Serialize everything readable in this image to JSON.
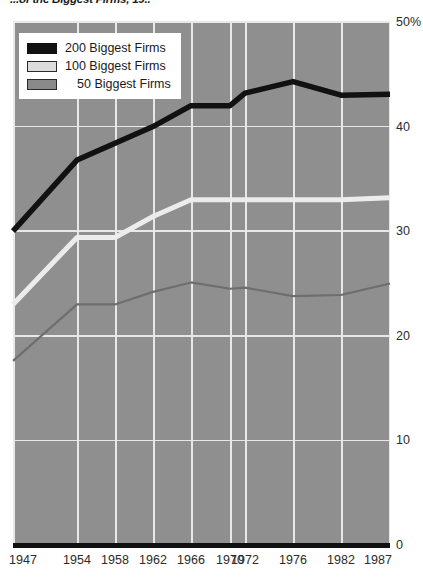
{
  "chart_data": {
    "type": "line",
    "title": "...of the Biggest Firms, 19..",
    "xlabel": "",
    "ylabel": "",
    "grid": true,
    "legend_position": "top-left",
    "x": [
      1947,
      1954,
      1958,
      1962,
      1966,
      1970,
      1972,
      1976,
      1982,
      1987
    ],
    "x_tick_labels": [
      "1947",
      "1954",
      "1958",
      "1962",
      "1966",
      "1970",
      "1972",
      "1976",
      "1982",
      "1987"
    ],
    "y_tick_labels": [
      "0",
      "10",
      "20",
      "30",
      "40",
      "50%"
    ],
    "y_ticks": [
      0,
      10,
      20,
      30,
      40,
      50
    ],
    "ylim": [
      0,
      50
    ],
    "series": [
      {
        "name": "200 Biggest Firms",
        "color": "#111111",
        "values": [
          30.0,
          36.8,
          38.4,
          40.0,
          42.0,
          42.0,
          43.2,
          44.3,
          43.0,
          43.1
        ]
      },
      {
        "name": "100 Biggest Firms",
        "color": "#ececec",
        "values": [
          23.0,
          29.4,
          29.4,
          31.4,
          33.0,
          33.0,
          33.0,
          33.0,
          33.0,
          33.2
        ]
      },
      {
        "name": "50 Biggest Firms",
        "color": "#6e6e6e",
        "values": [
          17.6,
          23.0,
          23.0,
          24.2,
          25.1,
          24.5,
          24.6,
          23.8,
          23.9,
          25.0
        ]
      }
    ]
  },
  "colors": {
    "plot_background": "#8f8f8f",
    "gridline": "#e8e8e8",
    "axis": "#111111",
    "text": "#2b2b2b"
  },
  "legend": {
    "items": [
      {
        "label": "200 Biggest Firms",
        "swatch": "s200"
      },
      {
        "label": "100 Biggest Firms",
        "swatch": "s100"
      },
      {
        "label": "50 Biggest Firms",
        "swatch": "s50"
      }
    ]
  }
}
